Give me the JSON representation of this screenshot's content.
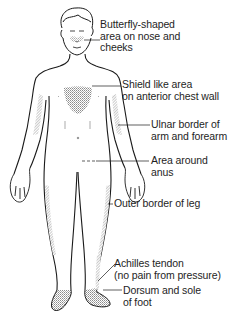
{
  "diagram": {
    "colors": {
      "outline": "#1a1a1a",
      "shading": "#9a9a9a",
      "background": "#ffffff"
    },
    "labels": [
      {
        "id": "butterfly",
        "lines": [
          "Butterfly-shaped",
          "area on nose and",
          "cheeks"
        ]
      },
      {
        "id": "shield",
        "lines": [
          "Shield like area",
          "on anterior chest wall"
        ]
      },
      {
        "id": "ulnar",
        "lines": [
          "Ulnar border of",
          "arm and forearm"
        ]
      },
      {
        "id": "anus",
        "lines": [
          "Area around",
          "anus"
        ]
      },
      {
        "id": "leg",
        "lines": [
          "Outer border of leg"
        ]
      },
      {
        "id": "achilles",
        "lines": [
          "Achilles tendon",
          "(no pain from pressure)"
        ]
      },
      {
        "id": "foot",
        "lines": [
          "Dorsum and sole",
          "of foot"
        ]
      }
    ]
  }
}
